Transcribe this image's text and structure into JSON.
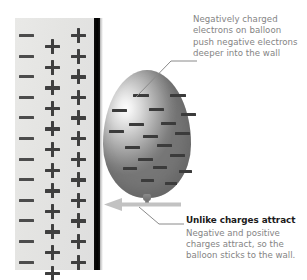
{
  "figure": {
    "kind": "science-illustration"
  },
  "wall": {
    "name": "wall-surface",
    "background_color": "#e5e5e3",
    "edge_color": "#000000",
    "charge_rows": [
      {
        "minus": "−",
        "plus_mid": "+",
        "plus_right": "+"
      },
      {
        "minus": "−",
        "plus_mid": "+",
        "plus_right": "+"
      },
      {
        "minus": "−",
        "plus_mid": "+",
        "plus_right": "+"
      },
      {
        "minus": "−",
        "plus_mid": "+",
        "plus_right": "+"
      },
      {
        "minus": "−",
        "plus_mid": "+",
        "plus_right": "+"
      },
      {
        "minus": "−",
        "plus_mid": "+",
        "plus_right": "+"
      },
      {
        "minus": "−",
        "plus_mid": "+",
        "plus_right": "+"
      },
      {
        "minus": "−",
        "plus_mid": "+",
        "plus_right": "+"
      },
      {
        "minus": "−",
        "plus_mid": "+",
        "plus_right": "+"
      },
      {
        "minus": "−",
        "plus_mid": "+",
        "plus_right": "+"
      },
      {
        "minus": "−",
        "plus_mid": "+",
        "plus_right": "+"
      },
      {
        "minus": "−",
        "plus_mid": "+",
        "plus_right": "+"
      }
    ],
    "minus_symbol": "−",
    "plus_symbol": "+"
  },
  "balloon": {
    "name": "balloon",
    "fill_light": "#fdfdfd",
    "fill_dark": "#767676",
    "electron_symbol": "−",
    "electron_count": 19
  },
  "annotations": {
    "top_note": "Negatively charged\nelectrons on balloon\npush negative electrons\ndeeper into the wall",
    "caption_title": "Unlike charges attract",
    "caption_body": "Negative and positive\ncharges attract, so the\nballoon sticks to the wall.",
    "text_color": "#848484",
    "title_color": "#1b1b1b",
    "arrow_color": "#bdbdbd",
    "leader_color": "#8a8a8a"
  }
}
